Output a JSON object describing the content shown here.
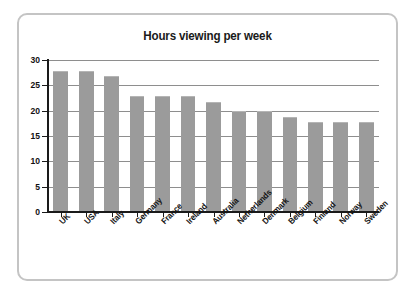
{
  "frame": {
    "border_color": "#c4c4c4",
    "background": "#ffffff"
  },
  "chart_data": {
    "type": "bar",
    "title": "Hours viewing per week",
    "xlabel": "",
    "ylabel": "",
    "ylim": [
      0,
      30
    ],
    "ytick_step": 5,
    "ytick_labels": [
      "0",
      "5",
      "10",
      "15",
      "20",
      "25",
      "30"
    ],
    "grid": true,
    "grid_axis": "y",
    "legend": "none",
    "bar_color": "#9b9b9b",
    "axis_color": "#1a1a1a",
    "categories": [
      "UK",
      "USA",
      "Italy",
      "Germany",
      "France",
      "Ireland",
      "Australia",
      "Netherlands",
      "Denmark",
      "Belgium",
      "Finland",
      "Norway",
      "Sweden"
    ],
    "values": [
      27.8,
      27.8,
      26.8,
      22.9,
      22.8,
      22.9,
      21.7,
      20.0,
      19.9,
      18.7,
      17.7,
      17.7,
      17.7
    ]
  }
}
